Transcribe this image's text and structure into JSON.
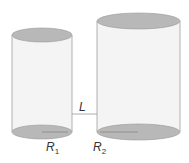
{
  "diagram": {
    "cylinders": [
      {
        "id": "cylinder-1",
        "label": "R",
        "subscript": "1"
      },
      {
        "id": "cylinder-2",
        "label": "R",
        "subscript": "2"
      }
    ],
    "connector_label": "L",
    "colors": {
      "ellipse_fill": "#b8b8b8",
      "body_fill": "#f4f4f4",
      "stroke": "#9a9a9a",
      "text": "#333333"
    }
  }
}
